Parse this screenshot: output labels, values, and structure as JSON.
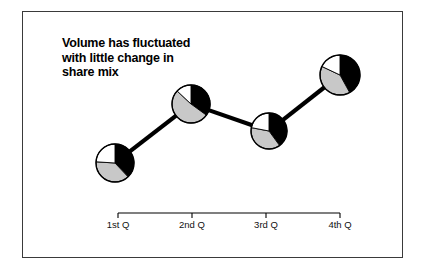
{
  "figure": {
    "title_lines": [
      "Volume has fluctuated",
      "with little change in",
      "share mix"
    ],
    "title_full": "Volume has fluctuated with little change in share mix"
  },
  "axis": {
    "tick_labels": [
      "1st Q",
      "2nd Q",
      "3rd Q",
      "4th Q"
    ]
  },
  "colors": {
    "black": "#000000",
    "gray": "#c8c8c8",
    "white": "#ffffff",
    "frame": "#3a3a3a",
    "connector": "#000000"
  },
  "chart_data": {
    "type": "pie",
    "title": "Volume has fluctuated with little change in share mix",
    "xlabel": "",
    "ylabel": "",
    "categories": [
      "1st Q",
      "2nd Q",
      "3rd Q",
      "4th Q"
    ],
    "x": [
      115,
      191,
      269,
      340
    ],
    "values": [
      163,
      104,
      131,
      75
    ],
    "value_meaning": "vertical position of each pie marker (higher on slide = greater volume); units unlabeled",
    "grid": false,
    "legend": "none",
    "annotations": [],
    "series": [
      {
        "name": "Black share",
        "values": [
          38,
          35,
          40,
          42
        ]
      },
      {
        "name": "Gray share",
        "values": [
          38,
          52,
          38,
          40
        ]
      },
      {
        "name": "White share",
        "values": [
          24,
          13,
          22,
          18
        ]
      }
    ],
    "pies": [
      {
        "category": "1st Q",
        "cx": 115,
        "cy": 163,
        "r": 19,
        "slices": [
          {
            "name": "black",
            "color": "#000000",
            "percent": 38
          },
          {
            "name": "gray",
            "color": "#c8c8c8",
            "percent": 38
          },
          {
            "name": "white",
            "color": "#ffffff",
            "percent": 24
          }
        ]
      },
      {
        "category": "2nd Q",
        "cx": 191,
        "cy": 104,
        "r": 19,
        "slices": [
          {
            "name": "black",
            "color": "#000000",
            "percent": 35
          },
          {
            "name": "gray",
            "color": "#c8c8c8",
            "percent": 52
          },
          {
            "name": "white",
            "color": "#ffffff",
            "percent": 13
          }
        ]
      },
      {
        "category": "3rd Q",
        "cx": 269,
        "cy": 131,
        "r": 18,
        "slices": [
          {
            "name": "black",
            "color": "#000000",
            "percent": 40
          },
          {
            "name": "gray",
            "color": "#c8c8c8",
            "percent": 38
          },
          {
            "name": "white",
            "color": "#ffffff",
            "percent": 22
          }
        ]
      },
      {
        "category": "4th Q",
        "cx": 340,
        "cy": 75,
        "r": 20,
        "slices": [
          {
            "name": "black",
            "color": "#000000",
            "percent": 42
          },
          {
            "name": "gray",
            "color": "#c8c8c8",
            "percent": 40
          },
          {
            "name": "white",
            "color": "#ffffff",
            "percent": 18
          }
        ]
      }
    ],
    "connectors": [
      {
        "from": "1st Q",
        "to": "2nd Q"
      },
      {
        "from": "2nd Q",
        "to": "3rd Q"
      },
      {
        "from": "3rd Q",
        "to": "4th Q"
      }
    ],
    "axis_line": {
      "x1": 118,
      "x2": 340,
      "y": 213
    },
    "ticks": [
      118,
      192,
      266,
      340
    ],
    "tick_label_y": 219
  }
}
